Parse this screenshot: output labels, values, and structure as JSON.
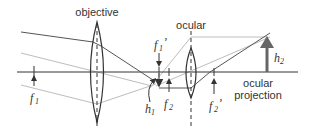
{
  "diagram": {
    "labels": {
      "objective": "objective",
      "ocular": "ocular",
      "ocular_projection_line1": "ocular",
      "ocular_projection_line2": "projection",
      "f1": "f",
      "f1_sub": "1",
      "f1_prime": "f",
      "f1_prime_sub": "1",
      "f1_prime_mark": "’",
      "f2": "f",
      "f2_sub": "2",
      "f2_prime": "f",
      "f2_prime_sub": "2",
      "f2_prime_mark": "’",
      "h1": "h",
      "h1_sub": "1",
      "h2": "h",
      "h2_sub": "2"
    },
    "colors": {
      "axis": "#333333",
      "dark_ray": "#555555",
      "light_ray": "#bbbbbb",
      "lens": "#333333",
      "arrow": "#555555"
    }
  }
}
